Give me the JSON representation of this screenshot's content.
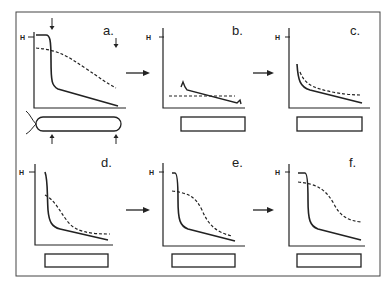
{
  "figure": {
    "panels": [
      {
        "id": "a",
        "label": "a.",
        "axis_label": "H"
      },
      {
        "id": "b",
        "label": "b.",
        "axis_label": "H"
      },
      {
        "id": "c",
        "label": "c.",
        "axis_label": "H"
      },
      {
        "id": "d",
        "label": "d.",
        "axis_label": "H"
      },
      {
        "id": "e",
        "label": "e.",
        "axis_label": "H"
      },
      {
        "id": "f",
        "label": "f.",
        "axis_label": "H"
      }
    ],
    "legend": {
      "solid_line": "solid curve",
      "dashed_line": "dashed curve"
    },
    "colors": {
      "ink": "#222222",
      "background": "#ffffff",
      "frame": "#444444"
    }
  }
}
